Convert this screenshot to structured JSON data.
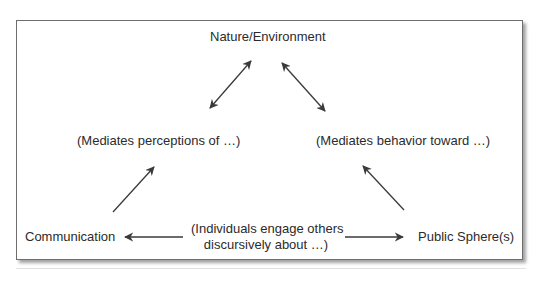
{
  "diagram": {
    "nodes": {
      "top": "Nature/Environment",
      "mid_left": "(Mediates perceptions of …)",
      "mid_right": "(Mediates behavior toward …)",
      "bottom_left": "Communication",
      "bottom_center_line1": "(Individuals engage others",
      "bottom_center_line2": "discursively about …)",
      "bottom_right": "Public Sphere(s)"
    },
    "edges": [
      {
        "from": "mid_left",
        "to": "top",
        "type": "bidirectional"
      },
      {
        "from": "top",
        "to": "mid_right",
        "type": "bidirectional"
      },
      {
        "from": "bottom_left",
        "to": "mid_left",
        "type": "directed"
      },
      {
        "from": "bottom_right",
        "to": "mid_right",
        "type": "directed"
      },
      {
        "from": "bottom_center",
        "to": "bottom_left",
        "type": "directed"
      },
      {
        "from": "bottom_center",
        "to": "bottom_right",
        "type": "directed"
      }
    ],
    "colors": {
      "text": "#2b2b2b",
      "arrow": "#3a3a3a",
      "border": "#6e6e6e"
    }
  }
}
